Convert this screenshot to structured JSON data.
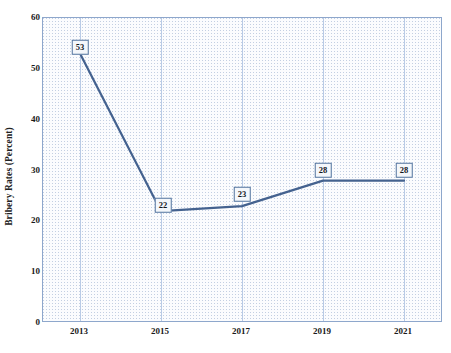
{
  "chart_data": {
    "type": "line",
    "title": "",
    "xlabel": "",
    "ylabel": "Bribery Rates (Percent)",
    "categories": [
      "2013",
      "2015",
      "2017",
      "2019",
      "2021"
    ],
    "x": [
      2013,
      2015,
      2017,
      2019,
      2021
    ],
    "values": [
      53,
      22,
      23,
      28,
      28
    ],
    "point_labels": [
      "53",
      "22",
      "23",
      "28",
      "28"
    ],
    "ylim": [
      0,
      60
    ],
    "y_ticks": [
      "0",
      "10",
      "20",
      "30",
      "40",
      "50",
      "60"
    ],
    "y_tick_values": [
      0,
      10,
      20,
      30,
      40,
      50,
      60
    ],
    "grid": "vertical-only",
    "legend": "none",
    "series": [
      {
        "name": "Bribery Rates (Percent)",
        "values": [
          53,
          22,
          23,
          28,
          28
        ],
        "color": "#44628f"
      }
    ],
    "colors": {
      "line": "#44628f",
      "gridline": "#b9cbe6",
      "plot_border": "#8ea7cc",
      "plot_background": "#fbfcfe",
      "label_box_border": "#53749f",
      "label_box_fill": "#f4f7fb",
      "text": "#1a1a1a"
    }
  }
}
